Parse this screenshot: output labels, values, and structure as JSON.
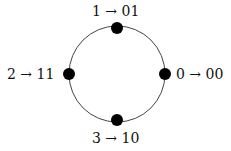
{
  "diagram": {
    "type": "circle-mapping",
    "circle": {
      "cx": 117,
      "cy": 74,
      "r": 48,
      "stroke": "#444444"
    },
    "nodes": [
      {
        "id": "0",
        "position": "right",
        "label": "0 → 00"
      },
      {
        "id": "1",
        "position": "top",
        "label": "1 → 01"
      },
      {
        "id": "2",
        "position": "left",
        "label": "2 → 11"
      },
      {
        "id": "3",
        "position": "bottom",
        "label": "3 → 10"
      }
    ],
    "dot_color": "#000000"
  }
}
